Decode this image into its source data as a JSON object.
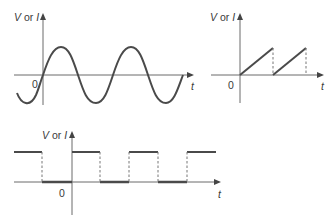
{
  "diagram": {
    "panels": [
      {
        "id": "sine",
        "waveform": "sinusoidal",
        "y_axis_label": {
          "prefix": "V",
          "or": " or ",
          "suffix": "I"
        },
        "x_axis_label": "t",
        "origin_label": "0"
      },
      {
        "id": "sawtooth",
        "waveform": "sawtooth",
        "y_axis_label": {
          "prefix": "V",
          "or": " or ",
          "suffix": "I"
        },
        "x_axis_label": "t",
        "origin_label": "0"
      },
      {
        "id": "square",
        "waveform": "square",
        "y_axis_label": {
          "prefix": "V",
          "or": " or ",
          "suffix": "I"
        },
        "x_axis_label": "t",
        "origin_label": "0"
      }
    ],
    "colors": {
      "curve": "#4a4a4a",
      "axis": "#6a6a6a",
      "dashed": "#777777",
      "background": "#ffffff"
    }
  }
}
